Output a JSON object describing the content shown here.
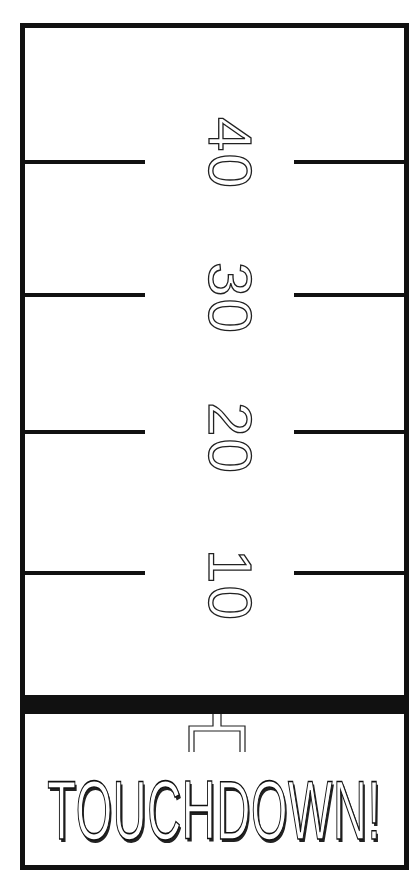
{
  "field": {
    "yard_markers": [
      {
        "label": "40"
      },
      {
        "label": "30"
      },
      {
        "label": "20"
      },
      {
        "label": "10"
      }
    ],
    "end_zone": {
      "goal_post": "goal-post-icon",
      "banner_text": "TOUCHDOWN!"
    }
  },
  "colors": {
    "ink": "#111111",
    "paper": "#ffffff"
  }
}
